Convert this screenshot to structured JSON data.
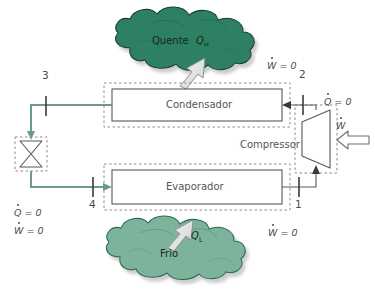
{
  "diagram": {
    "type": "process-flow",
    "background_color": "#ffffff",
    "pipe_color": "#6b9a91",
    "line_color": "#58585a",
    "hot_cloud_color": "#2e8063",
    "cold_cloud_color": "#7db39b",
    "arrow_fill": "#e8e8e8",
    "arrow_stroke": "#8a8a8a"
  },
  "components": {
    "condenser": {
      "label": "Condensador"
    },
    "evaporator": {
      "label": "Evaporador"
    },
    "compressor": {
      "label": "Compressor"
    },
    "valve": {
      "label": ""
    }
  },
  "reservoirs": {
    "hot": {
      "label": "Quente",
      "heat_symbol": "Q",
      "heat_subscript": "H"
    },
    "cold": {
      "label": "Frio",
      "heat_symbol": "Q",
      "heat_subscript": "L"
    }
  },
  "state_points": [
    {
      "id": "1",
      "label": "1"
    },
    {
      "id": "2",
      "label": "2"
    },
    {
      "id": "3",
      "label": "3"
    },
    {
      "id": "4",
      "label": "4"
    }
  ],
  "annotations": {
    "condenser_work": {
      "symbol": "W",
      "text": " = 0"
    },
    "evaporator_work": {
      "symbol": "W",
      "text": " = 0"
    },
    "compressor_heat": {
      "symbol": "Q",
      "text": " = 0"
    },
    "compressor_work": {
      "symbol": "W",
      "text": ""
    },
    "valve_heat": {
      "symbol": "Q",
      "text": " = 0"
    },
    "valve_work": {
      "symbol": "W",
      "text": " = 0"
    }
  }
}
